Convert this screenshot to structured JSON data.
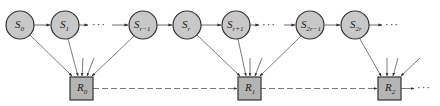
{
  "colors": {
    "state_fill": "#c8c8c8",
    "reward_fill": "#b4b4b4",
    "stroke": "#333333",
    "edge": "#444444"
  },
  "ellipsis": "···",
  "states": [
    {
      "id": "S0",
      "base": "S",
      "sub": "0",
      "cx": 20,
      "cy": 25
    },
    {
      "id": "S1",
      "base": "S",
      "sub": "1",
      "cx": 65,
      "cy": 25
    },
    {
      "id": "Sr-1",
      "base": "S",
      "sub": "r−1",
      "cx": 143,
      "cy": 25
    },
    {
      "id": "Sr",
      "base": "S",
      "sub": "r",
      "cx": 187,
      "cy": 25
    },
    {
      "id": "Sr+1",
      "base": "S",
      "sub": "r+1",
      "cx": 236,
      "cy": 25
    },
    {
      "id": "S2r-1",
      "base": "S",
      "sub": "2r−1",
      "cx": 310,
      "cy": 25
    },
    {
      "id": "S2r",
      "base": "S",
      "sub": "2r",
      "cx": 355,
      "cy": 25
    }
  ],
  "rewards": [
    {
      "id": "R0",
      "base": "R",
      "sub": "0",
      "x": 70,
      "y": 77
    },
    {
      "id": "R1",
      "base": "R",
      "sub": "1",
      "x": 238,
      "y": 77
    },
    {
      "id": "R2",
      "base": "R",
      "sub": "2",
      "x": 378,
      "y": 77
    }
  ]
}
